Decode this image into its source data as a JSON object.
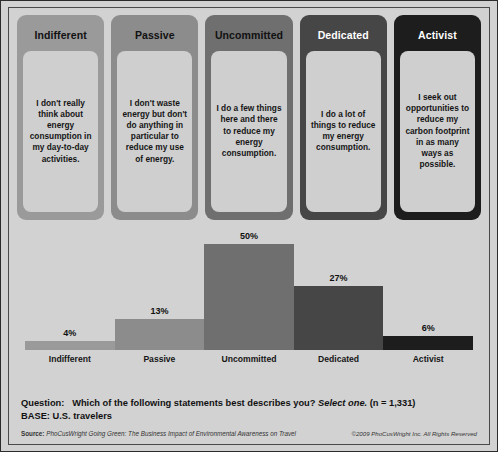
{
  "segments": [
    {
      "title": "Indifferent",
      "statement": "I don't really think about energy consumption in my day-to-day activities.",
      "card_color": "#9a9a9a",
      "title_color": "#111111"
    },
    {
      "title": "Passive",
      "statement": "I don't waste energy but don't do anything in particular to reduce my use of energy.",
      "card_color": "#8c8c8c",
      "title_color": "#111111"
    },
    {
      "title": "Uncommitted",
      "statement": "I do a few things here and there to reduce my energy consumption.",
      "card_color": "#6f6f6f",
      "title_color": "#111111"
    },
    {
      "title": "Dedicated",
      "statement": "I do a lot of things to reduce my energy consumption.",
      "card_color": "#464646",
      "title_color": "#ffffff"
    },
    {
      "title": "Activist",
      "statement": "I seek out opportunities to reduce my carbon footprint in as many ways as possible.",
      "card_color": "#1d1d1d",
      "title_color": "#ffffff"
    }
  ],
  "chart_data": {
    "type": "bar",
    "title": "",
    "xlabel": "",
    "ylabel": "",
    "ylim": [
      0,
      50
    ],
    "grid": false,
    "legend": "none",
    "categories": [
      "Indifferent",
      "Passive",
      "Uncommitted",
      "Dedicated",
      "Activist"
    ],
    "values": [
      4,
      13,
      50,
      27,
      6
    ],
    "value_labels": [
      "4%",
      "13%",
      "50%",
      "27%",
      "6%"
    ],
    "bar_colors": [
      "#9a9a9a",
      "#8c8c8c",
      "#6f6f6f",
      "#464646",
      "#1d1d1d"
    ]
  },
  "footer": {
    "question_label": "Question:",
    "question_text": "Which of the following statements best describes you?",
    "question_italic": "Select one.",
    "question_n": "(n = 1,331)",
    "base_label": "BASE:",
    "base_text": "U.S. travelers",
    "source_label": "Source:",
    "source_text": "PhoCusWright Going Green: The Business Impact of Environmental Awareness on Travel",
    "copyright": "©2009 PhoCusWright Inc. All Rights Reserved"
  }
}
